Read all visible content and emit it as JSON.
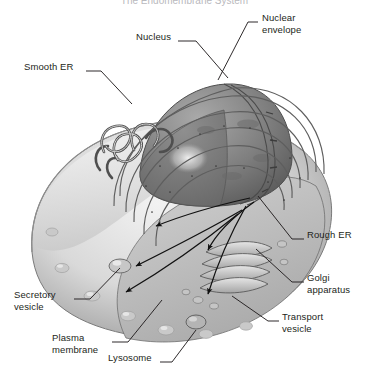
{
  "figure": {
    "kind": "cutaway-illustration",
    "style": "grayscale halftone textbook art",
    "background_color": "#ffffff",
    "ink_color": "#231f20",
    "cropped_title_top": "The Endomembrane System"
  },
  "labels": [
    {
      "id": "nucleus",
      "text": "Nucleus",
      "x": 136,
      "y": 36,
      "align": "left",
      "leader": "M 178 41 L 196 41 L 228 78"
    },
    {
      "id": "nuclear-envelope",
      "text": "Nuclear\nenvelope",
      "x": 262,
      "y": 17,
      "align": "left",
      "leader": "M 258 22 L 248 22 L 218 80"
    },
    {
      "id": "smooth-er",
      "text": "Smooth ER",
      "x": 24,
      "y": 66,
      "align": "left",
      "leader": "M 86 71 L 101 71 L 132 104"
    },
    {
      "id": "rough-er",
      "text": "Rough ER",
      "x": 307,
      "y": 234,
      "align": "left",
      "leader": "M 304 239 L 292 239 L 258 196"
    },
    {
      "id": "golgi-apparatus",
      "text": "Golgi\napparatus",
      "x": 307,
      "y": 277,
      "align": "left",
      "leader": "M 304 282 L 292 282 L 256 249"
    },
    {
      "id": "transport-vesicle",
      "text": "Transport\nvesicle",
      "x": 282,
      "y": 316,
      "align": "left",
      "leader": "M 279 321 L 268 321 L 232 296"
    },
    {
      "id": "secretory-vesicle",
      "text": "Secretory\nvesicle",
      "x": 14,
      "y": 294,
      "align": "left",
      "leader": "M 74 299 L 90 299 L 120 268"
    },
    {
      "id": "plasma-membrane",
      "text": "Plasma\nmembrane",
      "x": 52,
      "y": 337,
      "align": "left",
      "leader": "M 112 342 L 128 342 L 162 300"
    },
    {
      "id": "lysosome",
      "text": "Lysosome",
      "x": 108,
      "y": 357,
      "align": "left",
      "leader": "M 160 362 L 172 362 L 196 330"
    }
  ],
  "pathway_arrows": [
    {
      "id": "er-to-golgi-1",
      "from": "rough ER",
      "to": "golgi"
    },
    {
      "id": "er-to-golgi-2",
      "from": "rough ER",
      "to": "golgi"
    },
    {
      "id": "golgi-to-lysosome",
      "from": "golgi",
      "to": "lysosome"
    },
    {
      "id": "golgi-to-membrane-1",
      "from": "golgi",
      "to": "plasma membrane"
    },
    {
      "id": "golgi-to-membrane-2",
      "from": "golgi",
      "to": "secretory vesicle"
    }
  ]
}
